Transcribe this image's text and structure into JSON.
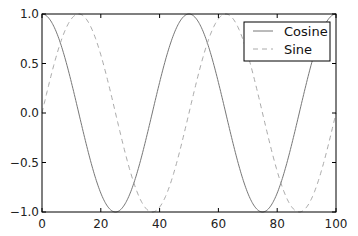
{
  "chart_data": {
    "type": "line",
    "title": "",
    "xlabel": "",
    "ylabel": "",
    "xlim": [
      0,
      100
    ],
    "ylim": [
      -1.0,
      1.0
    ],
    "grid": false,
    "legend_position": "upper right",
    "x_ticks": [
      "0",
      "20",
      "40",
      "60",
      "80",
      "100"
    ],
    "y_ticks": [
      "1.0",
      "0.5",
      "0.0",
      "-0.5",
      "-1.0"
    ],
    "series": [
      {
        "name": "Cosine",
        "style": "solid",
        "color": "#777777",
        "function": "cos(2*pi*x/50)",
        "x": [
          0,
          12.5,
          25,
          37.5,
          50,
          62.5,
          75,
          87.5,
          100
        ],
        "values": [
          1.0,
          0.0,
          -1.0,
          0.0,
          1.0,
          0.0,
          -1.0,
          0.0,
          1.0
        ]
      },
      {
        "name": "Sine",
        "style": "dashed",
        "color": "#aaaaaa",
        "function": "sin(2*pi*x/50)",
        "x": [
          0,
          12.5,
          25,
          37.5,
          50,
          62.5,
          75,
          87.5,
          100
        ],
        "values": [
          0.0,
          1.0,
          0.0,
          -1.0,
          0.0,
          1.0,
          0.0,
          -1.0,
          0.0
        ]
      }
    ]
  },
  "legend": {
    "items": [
      {
        "label": "Cosine"
      },
      {
        "label": "Sine"
      }
    ]
  },
  "axes": {
    "x_ticks": [
      "0",
      "20",
      "40",
      "60",
      "80",
      "100"
    ],
    "y_ticks": [
      "1.0",
      "0.5",
      "0.0",
      "−0.5",
      "−1.0"
    ]
  }
}
